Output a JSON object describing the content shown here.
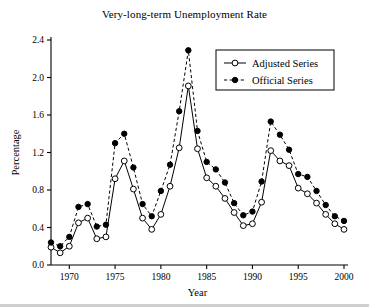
{
  "chart_data": {
    "type": "line",
    "title": "Very-long-term Unemployment Rate",
    "xlabel": "Year",
    "ylabel": "Percentage",
    "xlim": [
      1968,
      2000
    ],
    "ylim": [
      0.0,
      2.4
    ],
    "grid": false,
    "legend_position": "top-right",
    "x_ticks": [
      "1970",
      "1975",
      "1980",
      "1985",
      "1990",
      "1995",
      "2000"
    ],
    "x_tick_values": [
      1970,
      1975,
      1980,
      1985,
      1990,
      1995,
      2000
    ],
    "y_ticks": [
      "0.0",
      "0.4",
      "0.8",
      "1.2",
      "1.6",
      "2.0",
      "2.4"
    ],
    "y_tick_values": [
      0.0,
      0.4,
      0.8,
      1.2,
      1.6,
      2.0,
      2.4
    ],
    "x": [
      1968,
      1969,
      1970,
      1971,
      1972,
      1973,
      1974,
      1975,
      1976,
      1977,
      1978,
      1979,
      1980,
      1981,
      1982,
      1983,
      1984,
      1985,
      1986,
      1987,
      1988,
      1989,
      1990,
      1991,
      1992,
      1993,
      1994,
      1995,
      1996,
      1997,
      1998,
      1999,
      2000
    ],
    "series": [
      {
        "name": "Adjusted Series",
        "marker": "open-circle",
        "line_style": "solid",
        "color": "#000000",
        "values": [
          0.19,
          0.13,
          0.2,
          0.45,
          0.5,
          0.28,
          0.3,
          0.92,
          1.11,
          0.81,
          0.5,
          0.38,
          0.54,
          0.84,
          1.25,
          1.91,
          1.24,
          0.93,
          0.84,
          0.71,
          0.56,
          0.42,
          0.44,
          0.67,
          1.22,
          1.11,
          1.06,
          0.82,
          0.76,
          0.66,
          0.54,
          0.44,
          0.38
        ]
      },
      {
        "name": "Official Series",
        "marker": "filled-circle",
        "line_style": "dashed",
        "color": "#000000",
        "values": [
          0.24,
          0.2,
          0.3,
          0.62,
          0.65,
          0.41,
          0.43,
          1.3,
          1.4,
          1.04,
          0.65,
          0.52,
          0.79,
          1.07,
          1.64,
          2.29,
          1.43,
          1.1,
          1.02,
          0.88,
          0.66,
          0.53,
          0.57,
          0.89,
          1.53,
          1.39,
          1.23,
          0.97,
          0.94,
          0.79,
          0.64,
          0.52,
          0.47
        ]
      }
    ]
  },
  "legend": {
    "entries": [
      {
        "label": "Adjusted Series"
      },
      {
        "label": "Official Series"
      }
    ]
  }
}
